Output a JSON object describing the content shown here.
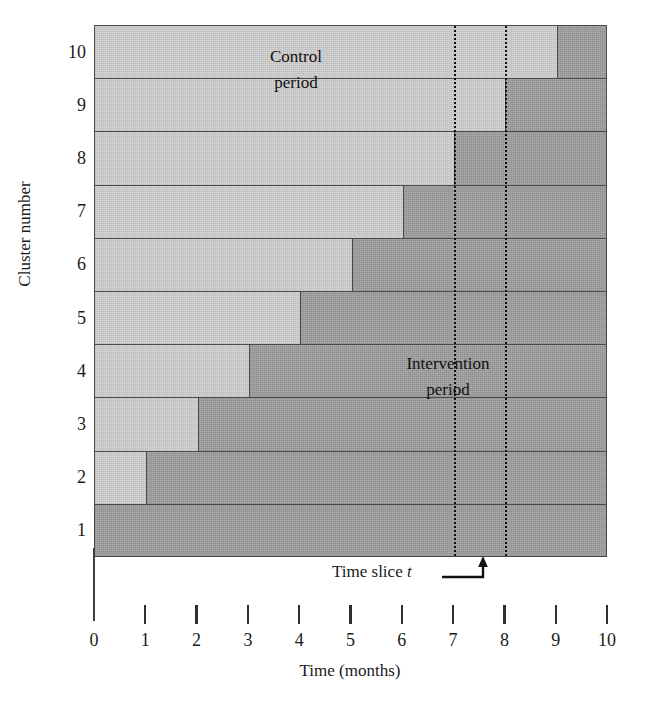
{
  "figure": {
    "type": "stepped-wedge-design-diagram",
    "colors": {
      "control_fill": "#d5d5d5",
      "intervention_fill": "#a9a9a9",
      "line": "#4a4a4a",
      "text": "#111111"
    }
  },
  "axes": {
    "y_title": "Cluster number",
    "y_ticks": [
      "10",
      "9",
      "8",
      "7",
      "6",
      "5",
      "4",
      "3",
      "2",
      "1"
    ],
    "x_title": "Time (months)",
    "x_ticks": [
      "0",
      "1",
      "2",
      "3",
      "4",
      "5",
      "6",
      "7",
      "8",
      "9",
      "10"
    ],
    "x_min": 0,
    "x_max": 10
  },
  "regions": {
    "control_label_line1": "Control",
    "control_label_line2": "period",
    "intervention_label_line1": "Intervention",
    "intervention_label_line2": "period"
  },
  "annotation": {
    "time_slice_text": "Time slice",
    "time_slice_symbol": "t",
    "time_slice_value": 7.5,
    "slice_bounds": [
      7,
      8
    ]
  },
  "chart_data": {
    "type": "bar",
    "title": "",
    "xlabel": "Time (months)",
    "ylabel": "Cluster number",
    "xlim": [
      0,
      10
    ],
    "categories": [
      "1",
      "2",
      "3",
      "4",
      "5",
      "6",
      "7",
      "8",
      "9",
      "10"
    ],
    "legend": [
      "Control period",
      "Intervention period"
    ],
    "grid": false,
    "rows": [
      {
        "cluster": 10,
        "control_start": 0,
        "crossover_month": 9,
        "control_months": 9,
        "intervention_months": 1
      },
      {
        "cluster": 9,
        "control_start": 0,
        "crossover_month": 8,
        "control_months": 8,
        "intervention_months": 2
      },
      {
        "cluster": 8,
        "control_start": 0,
        "crossover_month": 7,
        "control_months": 7,
        "intervention_months": 3
      },
      {
        "cluster": 7,
        "control_start": 0,
        "crossover_month": 6,
        "control_months": 6,
        "intervention_months": 4
      },
      {
        "cluster": 6,
        "control_start": 0,
        "crossover_month": 5,
        "control_months": 5,
        "intervention_months": 5
      },
      {
        "cluster": 5,
        "control_start": 0,
        "crossover_month": 4,
        "control_months": 4,
        "intervention_months": 6
      },
      {
        "cluster": 4,
        "control_start": 0,
        "crossover_month": 3,
        "control_months": 3,
        "intervention_months": 7
      },
      {
        "cluster": 3,
        "control_start": 0,
        "crossover_month": 2,
        "control_months": 2,
        "intervention_months": 8
      },
      {
        "cluster": 2,
        "control_start": 0,
        "crossover_month": 1,
        "control_months": 1,
        "intervention_months": 9
      },
      {
        "cluster": 1,
        "control_start": 0,
        "crossover_month": 0,
        "control_months": 0,
        "intervention_months": 10
      }
    ],
    "vertical_markers": [
      7,
      8
    ]
  }
}
